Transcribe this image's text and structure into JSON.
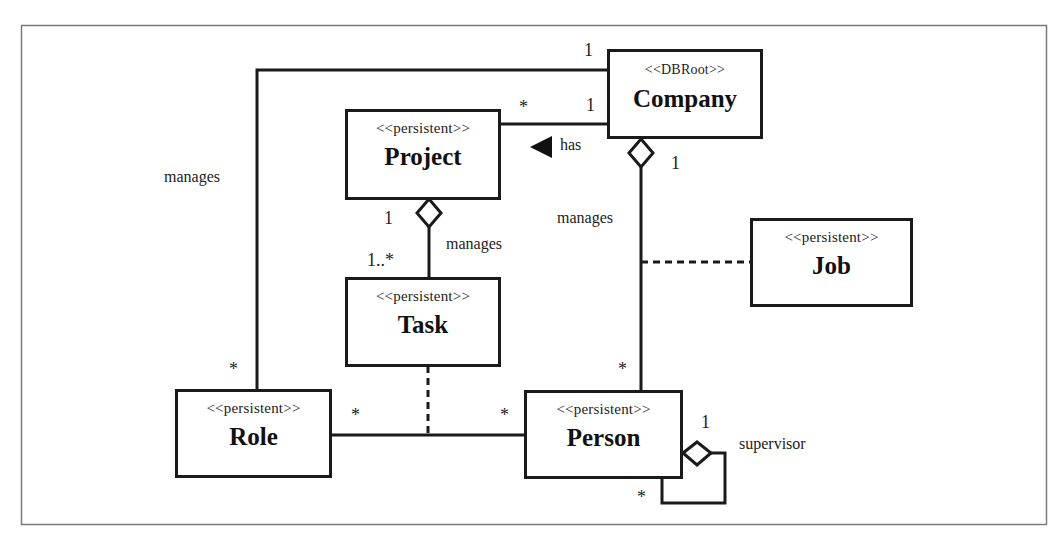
{
  "diagram": {
    "type": "UML class diagram",
    "colors": {
      "line": "#1a1a1a",
      "frame": "#7a7a7a",
      "background": "#ffffff"
    },
    "classes": [
      {
        "id": "company",
        "stereotype": "<<DBRoot>>",
        "name": "Company"
      },
      {
        "id": "project",
        "stereotype": "<<persistent>>",
        "name": "Project"
      },
      {
        "id": "task",
        "stereotype": "<<persistent>>",
        "name": "Task"
      },
      {
        "id": "job",
        "stereotype": "<<persistent>>",
        "name": "Job"
      },
      {
        "id": "role",
        "stereotype": "<<persistent>>",
        "name": "Role"
      },
      {
        "id": "person",
        "stereotype": "<<persistent>>",
        "name": "Person"
      }
    ],
    "associations": [
      {
        "id": "company-role",
        "label": "manages",
        "from": "Company",
        "to": "Role",
        "from_mult": "1",
        "to_mult": "*"
      },
      {
        "id": "company-project",
        "label": "has",
        "direction_arrow": "left-triangle",
        "from": "Company",
        "to": "Project",
        "from_mult": "1",
        "to_mult": "*"
      },
      {
        "id": "company-person",
        "label": "manages",
        "aggregation": "Company",
        "from": "Company",
        "to": "Person",
        "from_mult": "1",
        "to_mult": "*",
        "association_class": "Job"
      },
      {
        "id": "project-task",
        "label": "manages",
        "aggregation": "Project",
        "from": "Project",
        "to": "Task",
        "from_mult": "1",
        "to_mult": "1..*"
      },
      {
        "id": "role-person",
        "label": "",
        "from": "Role",
        "to": "Person",
        "from_mult": "*",
        "to_mult": "*",
        "association_class": "Task"
      },
      {
        "id": "person-self",
        "label": "supervisor",
        "aggregation": "Person",
        "from": "Person",
        "to": "Person",
        "from_mult": "1",
        "to_mult": "*"
      }
    ]
  }
}
